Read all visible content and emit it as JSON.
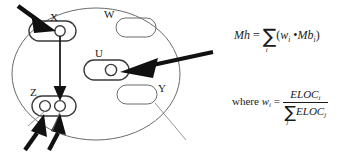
{
  "diagram": {
    "title_hidden": "",
    "container": {
      "shape": "ellipse",
      "label": "system-boundary"
    },
    "nodes": [
      {
        "id": "X",
        "label": "X",
        "type": "rounded-rect-with-circle",
        "circles": 1
      },
      {
        "id": "W",
        "label": "W",
        "type": "rounded-rect",
        "circles": 0
      },
      {
        "id": "U",
        "label": "U",
        "type": "rounded-rect-with-circle",
        "circles": 1
      },
      {
        "id": "Y",
        "label": "Y",
        "type": "rounded-rect",
        "circles": 0
      },
      {
        "id": "Z",
        "label": "Z",
        "type": "rounded-rect-with-circles",
        "circles": 2
      }
    ],
    "arrows": [
      {
        "name": "arrow-into-x",
        "from": "outside-top-left",
        "to": "X"
      },
      {
        "name": "arrow-x-to-z",
        "from": "X",
        "to": "Z"
      },
      {
        "name": "arrow-into-z-left",
        "from": "outside-bottom-left",
        "to": "Z-left-circle"
      },
      {
        "name": "arrow-into-z-right",
        "from": "outside-bottom-left",
        "to": "Z-right-circle"
      },
      {
        "name": "arrow-into-u",
        "from": "outside-right",
        "to": "U"
      }
    ]
  },
  "formulas": {
    "formula1": {
      "lhs": "Mh",
      "equals": "=",
      "sum_symbol": "∑",
      "sum_index": "i",
      "open_paren": "(",
      "term1": "w",
      "term1_sub": "i",
      "operator": "•",
      "term2": "Mb",
      "term2_sub": "i",
      "close_paren": ")",
      "plain": "Mh = ∑i (wi • Mbi)"
    },
    "formula2": {
      "where": "where",
      "lhs": "w",
      "lhs_sub": "i",
      "equals": "=",
      "numerator": "ELOC",
      "numerator_sub": "i",
      "sum_symbol": "∑",
      "sum_index": "j",
      "denominator": "ELOC",
      "denominator_sub": "j",
      "plain": "where wi = ELOCi / ∑j ELOCj"
    }
  },
  "colors": {
    "ink": "#1a1a1a",
    "outline": "#555555",
    "background": "#ffffff"
  }
}
